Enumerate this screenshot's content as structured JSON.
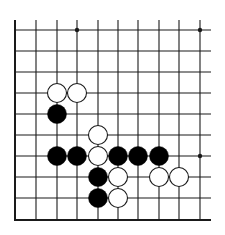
{
  "board": {
    "description": "Go board fragment (lower-left corner region)",
    "colors": {
      "background": "#ffffff",
      "line": "#1a1a1a",
      "black_stone": "#000000",
      "white_stone_fill": "#ffffff",
      "white_stone_stroke": "#1a1a1a"
    },
    "columns_x": [
      15,
      36,
      57,
      77,
      98,
      118,
      138,
      159,
      179,
      200
    ],
    "rows_y": [
      30,
      51,
      72,
      93,
      114,
      135,
      156,
      177,
      198,
      220
    ],
    "open_top_y": 20,
    "open_right_x": 211,
    "edges": {
      "left": true,
      "bottom": true,
      "top": false,
      "right": false
    },
    "star_points": [
      {
        "col": 3,
        "row": 0
      },
      {
        "col": 9,
        "row": 0
      },
      {
        "col": 9,
        "row": 6
      }
    ],
    "stones": [
      {
        "color": "white",
        "col": 2,
        "row": 3
      },
      {
        "color": "white",
        "col": 3,
        "row": 3
      },
      {
        "color": "black",
        "col": 2,
        "row": 4
      },
      {
        "color": "white",
        "col": 4,
        "row": 5
      },
      {
        "color": "black",
        "col": 2,
        "row": 6
      },
      {
        "color": "black",
        "col": 3,
        "row": 6
      },
      {
        "color": "white",
        "col": 4,
        "row": 6
      },
      {
        "color": "black",
        "col": 5,
        "row": 6
      },
      {
        "color": "black",
        "col": 6,
        "row": 6
      },
      {
        "color": "black",
        "col": 7,
        "row": 6
      },
      {
        "color": "black",
        "col": 4,
        "row": 7
      },
      {
        "color": "white",
        "col": 5,
        "row": 7
      },
      {
        "color": "white",
        "col": 7,
        "row": 7
      },
      {
        "color": "white",
        "col": 8,
        "row": 7
      },
      {
        "color": "black",
        "col": 4,
        "row": 8
      },
      {
        "color": "white",
        "col": 5,
        "row": 8
      }
    ],
    "stone_radius": 9.5,
    "star_radius": 2.2
  }
}
